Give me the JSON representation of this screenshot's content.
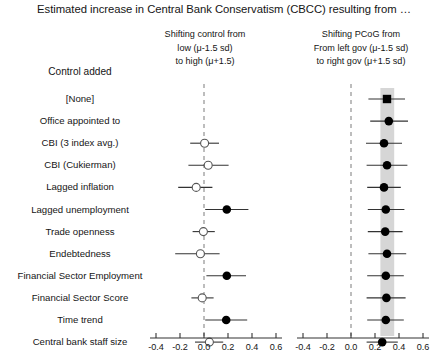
{
  "title": "Estimated increase in Central Bank Conservatism (CBCC) resulting from …",
  "row_header": "Control added",
  "panels": [
    {
      "id": "left",
      "header_lines": [
        "Shifting control from",
        "low (μ-1.5 sd)",
        "to high (μ+1.5)"
      ],
      "axis_ticks": [
        "-0.4",
        "-0.2",
        "0.0",
        "0.2",
        "0.4",
        "0.6"
      ],
      "band": null
    },
    {
      "id": "right",
      "header_lines": [
        "Shifting PCoG from",
        "From left gov (μ-1.5 sd)",
        "to right gov (μ+1.5 sd)"
      ],
      "axis_ticks": [
        "-0.4",
        "-0.2",
        "0.0",
        "0.2",
        "0.4",
        "0.6"
      ],
      "band": {
        "from": 0.245,
        "to": 0.36,
        "color": "#d6d6d6"
      }
    }
  ],
  "row_labels": [
    "[None]",
    "Office appointed to",
    "CBI (3 index avg.)",
    "CBI (Cukierman)",
    "Lagged inflation",
    "Lagged unemployment",
    "Trade openness",
    "Endebtedness",
    "Financial Sector Employment",
    "Financial Sector Score",
    "Time trend",
    "Central bank staff size"
  ],
  "colors": {
    "filled_marker": "#000000",
    "open_marker_edge": "#555555",
    "whisker": "#333333",
    "zero_line": "#888888",
    "axis": "#333333",
    "band": "#d6d6d6",
    "text": "#151515"
  },
  "chart_data": {
    "type": "scatter",
    "title": "Estimated increase in Central Bank Conservatism (CBCC) resulting from …",
    "xlabel": "",
    "ylabel": "Control added",
    "xlim": [
      -0.45,
      0.65
    ],
    "xticks": [
      -0.4,
      -0.2,
      0.0,
      0.2,
      0.4,
      0.6
    ],
    "grid": false,
    "legend": "none",
    "zero_reference_line": 0.0,
    "categories": [
      "[None]",
      "Office appointed to",
      "CBI (3 index avg.)",
      "CBI (Cukierman)",
      "Lagged inflation",
      "Lagged unemployment",
      "Trade openness",
      "Endebtedness",
      "Financial Sector Employment",
      "Financial Sector Score",
      "Time trend",
      "Central bank staff size"
    ],
    "series": [
      {
        "name": "Shifting control from low (μ-1.5 sd) to high (μ+1.5)",
        "panel": "left",
        "points": [
          {
            "category": "[None]",
            "estimate": null,
            "low": null,
            "high": null,
            "marker": "none"
          },
          {
            "category": "Office appointed to",
            "estimate": null,
            "low": null,
            "high": null,
            "marker": "none"
          },
          {
            "category": "CBI (3 index avg.)",
            "estimate": 0.005,
            "low": -0.115,
            "high": 0.125,
            "marker": "open-circle"
          },
          {
            "category": "CBI (Cukierman)",
            "estimate": 0.035,
            "low": -0.13,
            "high": 0.205,
            "marker": "open-circle"
          },
          {
            "category": "Lagged inflation",
            "estimate": -0.065,
            "low": -0.215,
            "high": 0.07,
            "marker": "open-circle"
          },
          {
            "category": "Lagged unemployment",
            "estimate": 0.19,
            "low": 0.01,
            "high": 0.37,
            "marker": "filled-circle"
          },
          {
            "category": "Trade openness",
            "estimate": -0.005,
            "low": -0.095,
            "high": 0.09,
            "marker": "open-circle"
          },
          {
            "category": "Endebtedness",
            "estimate": -0.03,
            "low": -0.24,
            "high": 0.13,
            "marker": "open-circle"
          },
          {
            "category": "Financial Sector Employment",
            "estimate": 0.19,
            "low": 0.02,
            "high": 0.35,
            "marker": "filled-circle"
          },
          {
            "category": "Financial Sector Score",
            "estimate": -0.015,
            "low": -0.105,
            "high": 0.08,
            "marker": "open-circle"
          },
          {
            "category": "Time trend",
            "estimate": 0.185,
            "low": 0.01,
            "high": 0.36,
            "marker": "filled-circle"
          },
          {
            "category": "Central bank staff size",
            "estimate": 0.045,
            "low": -0.075,
            "high": 0.16,
            "marker": "open-circle"
          }
        ]
      },
      {
        "name": "Shifting PCoG from left gov (μ-1.5 sd) to right gov (μ+1.5 sd)",
        "panel": "right",
        "points": [
          {
            "category": "[None]",
            "estimate": 0.3,
            "low": 0.145,
            "high": 0.45,
            "marker": "filled-square"
          },
          {
            "category": "Office appointed to",
            "estimate": 0.315,
            "low": 0.16,
            "high": 0.475,
            "marker": "filled-circle"
          },
          {
            "category": "CBI (3 index avg.)",
            "estimate": 0.275,
            "low": 0.125,
            "high": 0.425,
            "marker": "filled-circle"
          },
          {
            "category": "CBI (Cukierman)",
            "estimate": 0.3,
            "low": 0.13,
            "high": 0.47,
            "marker": "filled-circle"
          },
          {
            "category": "Lagged inflation",
            "estimate": 0.275,
            "low": 0.135,
            "high": 0.415,
            "marker": "filled-circle"
          },
          {
            "category": "Lagged unemployment",
            "estimate": 0.29,
            "low": 0.14,
            "high": 0.445,
            "marker": "filled-circle"
          },
          {
            "category": "Trade openness",
            "estimate": 0.285,
            "low": 0.14,
            "high": 0.43,
            "marker": "filled-circle"
          },
          {
            "category": "Endebtedness",
            "estimate": 0.3,
            "low": 0.145,
            "high": 0.46,
            "marker": "filled-circle"
          },
          {
            "category": "Financial Sector Employment",
            "estimate": 0.29,
            "low": 0.135,
            "high": 0.44,
            "marker": "filled-circle"
          },
          {
            "category": "Financial Sector Score",
            "estimate": 0.295,
            "low": 0.13,
            "high": 0.455,
            "marker": "filled-circle"
          },
          {
            "category": "Time trend",
            "estimate": 0.29,
            "low": 0.135,
            "high": 0.44,
            "marker": "filled-circle"
          },
          {
            "category": "Central bank staff size",
            "estimate": 0.26,
            "low": 0.13,
            "high": 0.39,
            "marker": "filled-circle"
          }
        ]
      }
    ]
  }
}
